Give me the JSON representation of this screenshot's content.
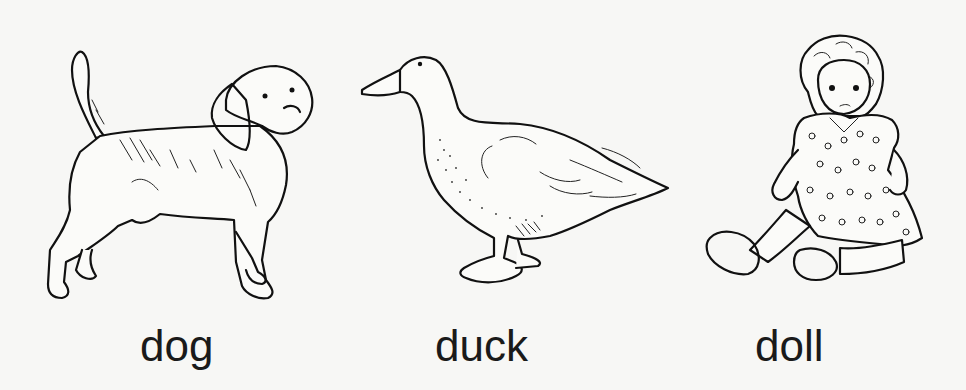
{
  "page": {
    "background": "#f7f7f5",
    "ink_color": "#111111"
  },
  "figures": [
    {
      "id": "dog",
      "label": "dog",
      "subject": "beagle-dog-illustration"
    },
    {
      "id": "duck",
      "label": "duck",
      "subject": "duck-illustration"
    },
    {
      "id": "doll",
      "label": "doll",
      "subject": "sitting-doll-illustration"
    }
  ]
}
